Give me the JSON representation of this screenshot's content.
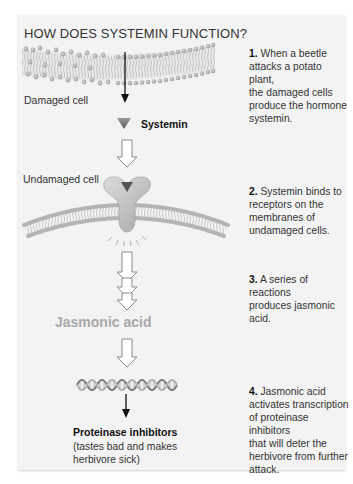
{
  "title": "HOW DOES SYSTEMIN FUNCTION?",
  "diagram": {
    "damaged_cell_label": "Damaged cell",
    "systemin_label": "Systemin",
    "undamaged_cell_label": "Undamaged cell",
    "jasmonic_acid_label": "Jasmonic acid",
    "proteinase_label": "Proteinase inhibitors",
    "proteinase_note_line1": "(tastes bad and makes",
    "proteinase_note_line2": "herbivore sick)"
  },
  "steps": [
    {
      "number": "1.",
      "lines": [
        "When a beetle",
        "attacks a potato plant,",
        "the damaged cells",
        "produce the hormone",
        "systemin."
      ]
    },
    {
      "number": "2.",
      "lines": [
        "Systemin binds to",
        "receptors on the",
        "membranes of",
        "undamaged cells."
      ]
    },
    {
      "number": "3.",
      "lines": [
        "A series of reactions",
        "produces jasmonic",
        "acid."
      ]
    },
    {
      "number": "4.",
      "lines": [
        "Jasmonic acid",
        "activates transcription",
        "of proteinase inhibitors",
        "that will deter the",
        "herbivore from further",
        "attack."
      ]
    }
  ],
  "colors": {
    "panel": "#f3f3f3",
    "membrane": "#bdbdbd",
    "membrane_head": "#a9a9a9",
    "jasmonic_text": "#a8a8a8",
    "systemin_triangle": "#6f6f6f"
  }
}
